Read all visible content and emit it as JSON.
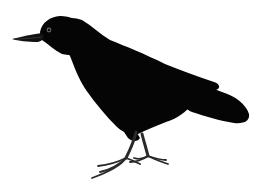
{
  "image": {
    "subject": "crow",
    "description": "Black crow illustration standing in profile, facing left, on white background",
    "colors": {
      "background": "#ffffff",
      "body": "#050505",
      "legs": "#2a2a2a",
      "eye": "#6a6a6a"
    }
  }
}
